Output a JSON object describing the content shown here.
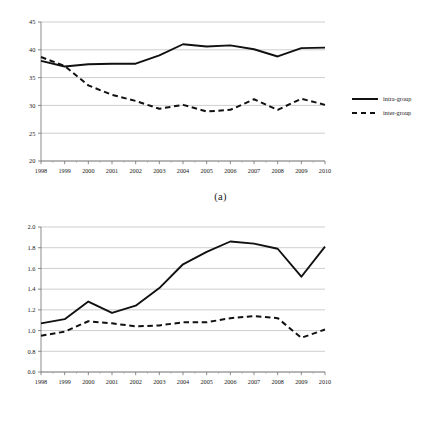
{
  "figure": {
    "panels": [
      {
        "id": "a",
        "caption": "(a)",
        "legend": [
          {
            "label": "intra-group",
            "style": "solid"
          },
          {
            "label": "inter-group",
            "style": "dashed"
          }
        ]
      },
      {
        "id": "b",
        "caption": "(b)",
        "legend": [
          {
            "label": "intra-group",
            "style": "solid"
          },
          {
            "label": "inter-group",
            "style": "dashed"
          }
        ]
      }
    ]
  },
  "chart_data": [
    {
      "type": "line",
      "panel": "(a)",
      "title": "",
      "xlabel": "",
      "ylabel": "",
      "x": [
        1998,
        1999,
        2000,
        2001,
        2002,
        2003,
        2004,
        2005,
        2006,
        2007,
        2008,
        2009,
        2010
      ],
      "categories": [
        "1998",
        "1999",
        "2000",
        "2001",
        "2002",
        "2003",
        "2004",
        "2005",
        "2006",
        "2007",
        "2008",
        "2009",
        "2010"
      ],
      "ylim": [
        20,
        45
      ],
      "yticks": [
        20,
        25,
        30,
        35,
        40,
        45
      ],
      "ytick_labels": [
        "20",
        "25",
        "30",
        "35",
        "40",
        "45"
      ],
      "xlim": [
        1998,
        2010
      ],
      "grid": true,
      "legend_position": "right",
      "series": [
        {
          "name": "intra-group",
          "style": "solid",
          "color": "#111111",
          "values": [
            38.0,
            37.0,
            37.4,
            37.5,
            37.5,
            39.0,
            41.0,
            40.6,
            40.8,
            40.1,
            38.8,
            40.3,
            40.4
          ]
        },
        {
          "name": "inter-group",
          "style": "dashed",
          "color": "#111111",
          "values": [
            38.7,
            37.1,
            33.6,
            31.9,
            30.8,
            29.4,
            30.1,
            28.9,
            29.2,
            31.1,
            29.2,
            31.2,
            30.1
          ]
        }
      ]
    },
    {
      "type": "line",
      "panel": "(b)",
      "title": "",
      "xlabel": "",
      "ylabel": "",
      "x": [
        1998,
        1999,
        2000,
        2001,
        2002,
        2003,
        2004,
        2005,
        2006,
        2007,
        2008,
        2009,
        2010
      ],
      "categories": [
        "1998",
        "1999",
        "2000",
        "2001",
        "2002",
        "2003",
        "2004",
        "2005",
        "2006",
        "2007",
        "2008",
        "2009",
        "2010"
      ],
      "ylim": [
        0.6,
        2.0
      ],
      "yticks": [
        0.6,
        0.8,
        1.0,
        1.2,
        1.4,
        1.6,
        1.8,
        2.0
      ],
      "ytick_labels": [
        "0.6",
        "0.8",
        "1.0",
        "1.2",
        "1.4",
        "1.6",
        "1.8",
        "2.0"
      ],
      "xlim": [
        1998,
        2010
      ],
      "grid": true,
      "legend_position": "right",
      "series": [
        {
          "name": "intra-group",
          "style": "solid",
          "color": "#111111",
          "values": [
            1.07,
            1.11,
            1.28,
            1.17,
            1.24,
            1.41,
            1.64,
            1.76,
            1.86,
            1.84,
            1.79,
            1.52,
            1.81
          ]
        },
        {
          "name": "inter-group",
          "style": "dashed",
          "color": "#111111",
          "values": [
            0.95,
            0.99,
            1.09,
            1.07,
            1.04,
            1.05,
            1.08,
            1.08,
            1.12,
            1.14,
            1.12,
            0.93,
            1.01
          ]
        }
      ]
    }
  ]
}
